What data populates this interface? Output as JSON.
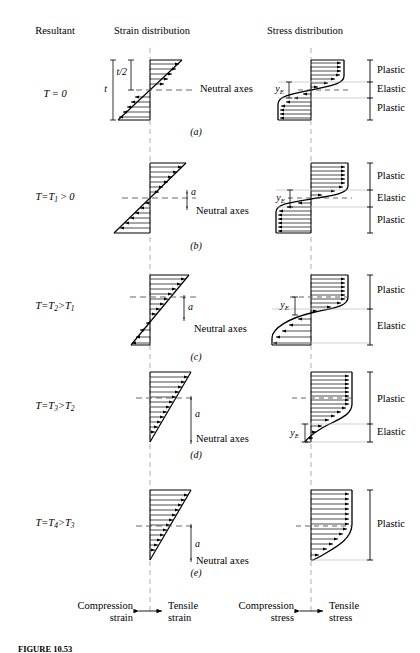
{
  "figure": {
    "caption": "FIGURE 10.53",
    "columns": {
      "resultant": "Resultant",
      "strain": "Strain distribution",
      "stress": "Stress distribution"
    },
    "neutral_axes_label": "Neutral axes",
    "dim_t": "t",
    "dim_t_half": "t/2",
    "dim_a": "a",
    "dim_yE": "y",
    "dim_yE_sub": "E",
    "band_plastic": "Plastic",
    "band_elastic": "Elastic",
    "legend": {
      "compression_strain_1": "Compression",
      "compression_strain_2": "strain",
      "tensile_strain_1": "Tensile",
      "tensile_strain_2": "strain",
      "compression_stress_1": "Compression",
      "compression_stress_2": "stress",
      "tensile_stress_1": "Tensile",
      "tensile_stress_2": "stress"
    },
    "rows": [
      {
        "id": "a",
        "sub_caption": "(a)",
        "resultant": "T = 0",
        "resultant_parts": {
          "lhs": "T",
          "eq": " = ",
          "rhs": "0"
        },
        "bands": [
          "Plastic",
          "Elastic",
          "Plastic"
        ],
        "shows_t": true,
        "shows_a": false,
        "shows_yE": true,
        "neutral_axis_offset": 0
      },
      {
        "id": "b",
        "sub_caption": "(b)",
        "resultant": "T = T1 > 0",
        "bands": [
          "Plastic",
          "Elastic",
          "Plastic"
        ],
        "shows_t": false,
        "shows_a": true,
        "shows_yE": true,
        "neutral_axis_offset": 1
      },
      {
        "id": "c",
        "sub_caption": "(c)",
        "resultant": "T = T2 > T1",
        "bands": [
          "Plastic",
          "Elastic"
        ],
        "shows_t": false,
        "shows_a": true,
        "shows_yE": true,
        "neutral_axis_offset": 2
      },
      {
        "id": "d",
        "sub_caption": "(d)",
        "resultant": "T = T3 > T2",
        "bands": [
          "Plastic",
          "Elastic"
        ],
        "shows_t": false,
        "shows_a": true,
        "shows_yE": true,
        "neutral_axis_offset": 3
      },
      {
        "id": "e",
        "sub_caption": "(e)",
        "resultant": "T = T4 > T3",
        "bands": [
          "Plastic"
        ],
        "shows_t": false,
        "shows_a": true,
        "shows_yE": false,
        "neutral_axis_offset": 4
      }
    ]
  },
  "colors": {
    "ink": "#000000",
    "dash": "#555555",
    "thin": "#999999",
    "background": "#ffffff"
  }
}
